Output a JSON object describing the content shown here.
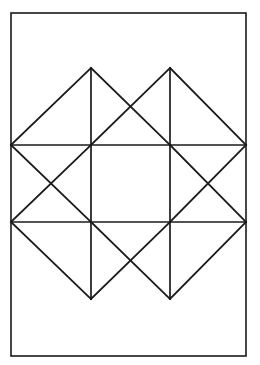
{
  "figure": {
    "background_color": "#ffffff",
    "stroke_color": "#1a1a1a",
    "border": {
      "name": "outer-rectangle",
      "x": 11,
      "y": 13,
      "width": 235,
      "height": 343,
      "stroke_width": 1.6
    },
    "grid": {
      "columns_x": [
        11,
        91,
        170,
        246
      ],
      "rows_y": [
        68,
        145,
        222,
        299
      ],
      "cell_width": 79.5,
      "cell_height": 77,
      "note": "3x3 lattice of cells inside the outer rectangle"
    },
    "vertices": {
      "top_apex_left": [
        91,
        68
      ],
      "top_apex_right": [
        170,
        68
      ],
      "left_vertex_upper": [
        11,
        145
      ],
      "left_vertex_lower": [
        11,
        222
      ],
      "right_vertex_upper": [
        246,
        145
      ],
      "right_vertex_lower": [
        246,
        222
      ],
      "bottom_apex_left": [
        91,
        299
      ],
      "bottom_apex_right": [
        170,
        299
      ],
      "center_top_left": [
        91,
        145
      ],
      "center_top_right": [
        170,
        145
      ],
      "center_bottom_left": [
        91,
        222
      ],
      "center_bottom_right": [
        170,
        222
      ]
    },
    "horizontal_lines": [
      {
        "name": "upper-horizontal",
        "x1": 11,
        "y1": 145,
        "x2": 246,
        "y2": 145
      },
      {
        "name": "lower-horizontal",
        "x1": 11,
        "y1": 222,
        "x2": 246,
        "y2": 222
      }
    ],
    "vertical_lines": [
      {
        "name": "left-vertical",
        "x1": 91,
        "y1": 68,
        "x2": 91,
        "y2": 299
      },
      {
        "name": "right-vertical",
        "x1": 170,
        "y1": 68,
        "x2": 170,
        "y2": 299
      }
    ],
    "diagonals": [
      {
        "name": "diagonal-top-left-outer",
        "x1": 11,
        "y1": 145,
        "x2": 91,
        "y2": 68
      },
      {
        "name": "diagonal-top-left-inner",
        "x1": 91,
        "y1": 68,
        "x2": 170,
        "y2": 145
      },
      {
        "name": "diagonal-top-mid-down",
        "x1": 91,
        "y1": 145,
        "x2": 170,
        "y2": 68
      },
      {
        "name": "diagonal-top-right-outer",
        "x1": 170,
        "y1": 68,
        "x2": 246,
        "y2": 145
      },
      {
        "name": "diagonal-midleft-down",
        "x1": 11,
        "y1": 145,
        "x2": 91,
        "y2": 222
      },
      {
        "name": "diagonal-midleft-up",
        "x1": 11,
        "y1": 222,
        "x2": 91,
        "y2": 145
      },
      {
        "name": "diagonal-midright-down",
        "x1": 170,
        "y1": 145,
        "x2": 246,
        "y2": 222
      },
      {
        "name": "diagonal-midright-up",
        "x1": 170,
        "y1": 222,
        "x2": 246,
        "y2": 145
      },
      {
        "name": "diagonal-bottom-left-outer",
        "x1": 11,
        "y1": 222,
        "x2": 91,
        "y2": 299
      },
      {
        "name": "diagonal-bottom-mid-down",
        "x1": 91,
        "y1": 222,
        "x2": 170,
        "y2": 299
      },
      {
        "name": "diagonal-bottom-mid-up",
        "x1": 91,
        "y1": 299,
        "x2": 170,
        "y2": 222
      },
      {
        "name": "diagonal-bottom-right-outer",
        "x1": 170,
        "y1": 299,
        "x2": 246,
        "y2": 222
      }
    ],
    "center_cell": {
      "name": "empty-center-square",
      "x": 91,
      "y": 145,
      "width": 79,
      "height": 77,
      "filled": false
    }
  }
}
